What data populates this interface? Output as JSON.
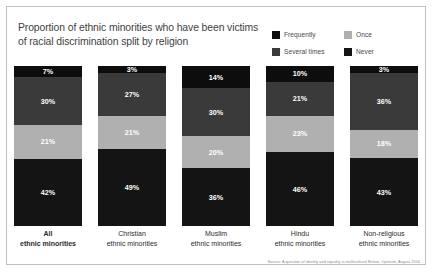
{
  "chart_data": {
    "type": "bar",
    "subtype": "stacked-bar-100-percent",
    "title": "Proportion of ethnic minorities who have been victims of racial discrimination split by religion",
    "title_line1": "Proportion of ethnic minorities who have been victims",
    "title_line2": "of racial discrimination split by religion",
    "xlabel": "",
    "ylabel": "",
    "ylim": [
      0,
      100
    ],
    "grid": false,
    "legend_position": "top-right",
    "value_suffix": "%",
    "categories": [
      "All ethnic minorities",
      "Christian ethnic minorities",
      "Muslim ethnic minorities",
      "Hindu ethnic minorities",
      "Non-religious ethnic minorities"
    ],
    "category_lines": [
      {
        "line1": "All",
        "line2": "ethnic minorities",
        "emphasis": true
      },
      {
        "line1": "Christian",
        "line2": "ethnic minorities",
        "emphasis": false
      },
      {
        "line1": "Muslim",
        "line2": "ethnic minorities",
        "emphasis": false
      },
      {
        "line1": "Hindu",
        "line2": "ethnic minorities",
        "emphasis": false
      },
      {
        "line1": "Non-religious",
        "line2": "ethnic minorities",
        "emphasis": false
      }
    ],
    "series": [
      {
        "name": "Frequently",
        "color": "#0d0d0d",
        "label_color": "#ffffff",
        "values": [
          7,
          3,
          14,
          10,
          3
        ]
      },
      {
        "name": "Several times",
        "color": "#3a3a3a",
        "label_color": "#ffffff",
        "values": [
          30,
          27,
          30,
          21,
          36
        ]
      },
      {
        "name": "Once",
        "color": "#b0b0b0",
        "label_color": "#ffffff",
        "values": [
          21,
          21,
          20,
          23,
          18
        ]
      },
      {
        "name": "Never",
        "color": "#141414",
        "label_color": "#ffffff",
        "values": [
          42,
          49,
          36,
          46,
          43
        ]
      }
    ],
    "data_labels": [
      [
        "7%",
        "30%",
        "21%",
        "42%"
      ],
      [
        "3%",
        "27%",
        "21%",
        "49%"
      ],
      [
        "14%",
        "30%",
        "20%",
        "36%"
      ],
      [
        "10%",
        "21%",
        "23%",
        "46%"
      ],
      [
        "3%",
        "36%",
        "18%",
        "43%"
      ]
    ]
  },
  "legend": {
    "items": [
      {
        "label": "Frequently",
        "color": "#0d0d0d"
      },
      {
        "label": "Once",
        "color": "#b0b0b0"
      },
      {
        "label": "Several times",
        "color": "#3a3a3a"
      },
      {
        "label": "Never",
        "color": "#141414"
      }
    ]
  },
  "source": {
    "text": "Source: A question of identity and equality in multicultural Britain, Opinium, August 2016"
  },
  "colors": {
    "frame_border": "#bfbfbf",
    "background": "#ffffff",
    "title_text": "#3f3f3f",
    "category_text": "#2b2b2b",
    "source_text": "#8c8c8c"
  }
}
